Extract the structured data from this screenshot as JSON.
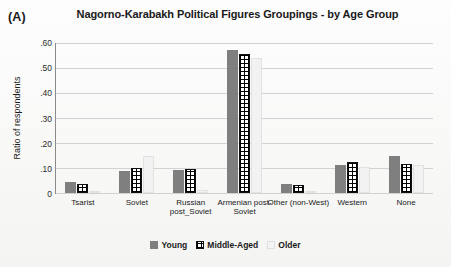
{
  "panel": {
    "letter": "(A)"
  },
  "chart_data": {
    "type": "bar",
    "title": "Nagorno-Karabakh Political Figures Groupings - by Age Group",
    "xlabel": "",
    "ylabel": "Ratio of respondents",
    "ylim": [
      0,
      0.6
    ],
    "grid": true,
    "legend_position": "bottom",
    "ytick_labels": [
      ".60",
      ".50",
      ".40",
      ".30",
      ".20",
      ".10",
      "0"
    ],
    "ytick_values": [
      0.6,
      0.5,
      0.4,
      0.3,
      0.2,
      0.1,
      0
    ],
    "categories": [
      "Tsarist",
      "Soviet",
      "Russian post_Soviet",
      "Armenian post-Soviet",
      "Other (non-West)",
      "Western",
      "None"
    ],
    "series": [
      {
        "name": "Young",
        "values": [
          0.044,
          0.087,
          0.091,
          0.567,
          0.035,
          0.111,
          0.147
        ]
      },
      {
        "name": "Middle-Aged",
        "values": [
          0.036,
          0.099,
          0.095,
          0.551,
          0.03,
          0.123,
          0.115
        ]
      },
      {
        "name": "Older",
        "values": [
          0.006,
          0.147,
          0.012,
          0.535,
          0.004,
          0.103,
          0.111
        ]
      }
    ]
  }
}
